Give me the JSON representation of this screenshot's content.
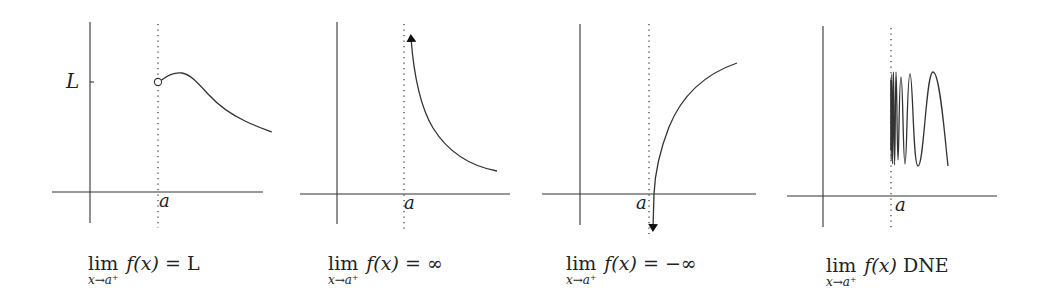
{
  "panels": [
    {
      "id": "right-limit-L",
      "point_label": "a",
      "y_label": "L",
      "caption": {
        "lim": "lim",
        "sub": "x→a⁺",
        "func": "f(x)",
        "relation": "= L"
      },
      "behavior": "curve approaches L from the right with an open circle at (a, L)"
    },
    {
      "id": "right-limit-infinity",
      "point_label": "a",
      "caption": {
        "lim": "lim",
        "sub": "x→a⁺",
        "func": "f(x)",
        "relation": "= ∞"
      },
      "behavior": "curve rises without bound as x approaches a from the right (arrow up)"
    },
    {
      "id": "right-limit-neg-infinity",
      "point_label": "a",
      "caption": {
        "lim": "lim",
        "sub": "x→a⁺",
        "func": "f(x)",
        "relation": "= −∞"
      },
      "behavior": "curve falls without bound as x approaches a from the right (arrow down)"
    },
    {
      "id": "right-limit-dne",
      "point_label": "a",
      "caption": {
        "lim": "lim",
        "sub": "x→a⁺",
        "func": "f(x)",
        "relation": "DNE"
      },
      "behavior": "curve oscillates with increasing frequency near a"
    }
  ]
}
